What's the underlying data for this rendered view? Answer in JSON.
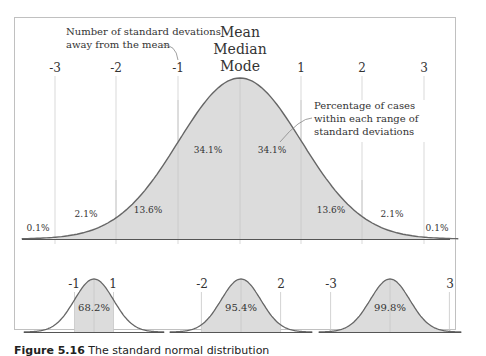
{
  "chart_data": {
    "type": "area",
    "title": "Standard normal distribution",
    "subtitle": "",
    "xlabel": "Number of standard devations away from the mean",
    "ylabel": "",
    "x_ticks": [
      "-3",
      "-2",
      "-1",
      "1",
      "2",
      "3"
    ],
    "center_label": [
      "Mean",
      "Median",
      "Mode"
    ],
    "segments": [
      {
        "range": "<-3",
        "percent": "0.1%"
      },
      {
        "range": "-3 to -2",
        "percent": "2.1%"
      },
      {
        "range": "-2 to -1",
        "percent": "13.6%"
      },
      {
        "range": "-1 to 0",
        "percent": "34.1%"
      },
      {
        "range": "0 to 1",
        "percent": "34.1%"
      },
      {
        "range": "1 to 2",
        "percent": "13.6%"
      },
      {
        "range": "2 to 3",
        "percent": "2.1%"
      },
      {
        "range": ">3",
        "percent": "0.1%"
      }
    ],
    "annotations": [
      "Number of standard devations away from the mean",
      "Percentage of cases within each range of standard deviations"
    ],
    "sub_charts": [
      {
        "range": [
          -1,
          1
        ],
        "labels": [
          "-1",
          "1"
        ],
        "percent": "68.2%"
      },
      {
        "range": [
          -2,
          2
        ],
        "labels": [
          "-2",
          "2"
        ],
        "percent": "95.4%"
      },
      {
        "range": [
          -3,
          3
        ],
        "labels": [
          "-3",
          "3"
        ],
        "percent": "99.8%"
      }
    ],
    "grid": false,
    "legend": "none"
  },
  "main": {
    "ticks": [
      "-3",
      "-2",
      "-1",
      "1",
      "2",
      "3"
    ],
    "center": {
      "line1": "Mean",
      "line2": "Median",
      "line3": "Mode"
    },
    "note_left": {
      "line1": "Number of standard devations",
      "line2": "away from the mean"
    },
    "note_right": {
      "line1": "Percentage of cases",
      "line2": "within each range of",
      "line3": "standard deviations"
    },
    "pcts": [
      "0.1%",
      "2.1%",
      "13.6%",
      "34.1%",
      "34.1%",
      "13.6%",
      "2.1%",
      "0.1%"
    ]
  },
  "small": [
    {
      "left": "-1",
      "right": "1",
      "pct": "68.2%"
    },
    {
      "left": "-2",
      "right": "2",
      "pct": "95.4%"
    },
    {
      "left": "-3",
      "right": "3",
      "pct": "99.8%"
    }
  ],
  "colors": {
    "fill": "#dcdcdc",
    "stroke": "#666666",
    "guide": "#cccccc",
    "frame": "#bbbbbb"
  },
  "caption": {
    "label": "Figure 5.16",
    "text": "The standard normal distribution"
  }
}
